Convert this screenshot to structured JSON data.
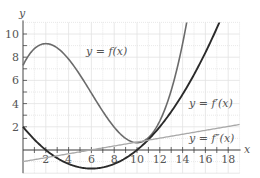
{
  "chart_data": {
    "type": "line",
    "title": "",
    "xlabel": "x",
    "ylabel": "y",
    "xlim": [
      0,
      19
    ],
    "ylim": [
      -2,
      11
    ],
    "grid": true,
    "x_ticks": [
      2,
      4,
      6,
      8,
      10,
      12,
      14,
      16,
      18
    ],
    "y_ticks": [
      2,
      4,
      6,
      8,
      10
    ],
    "x_tick_labels": [
      "2",
      "4",
      "6",
      "8",
      "10",
      "12",
      "14",
      "16",
      "18"
    ],
    "y_tick_labels": [
      "2",
      "4",
      "6",
      "8",
      "10"
    ],
    "series": [
      {
        "name": "y = f(x)",
        "label": "y = f(x)",
        "color": "#6b6b6b",
        "x": [
          0,
          1,
          2,
          3,
          4,
          5,
          6,
          7,
          8,
          9,
          10,
          11,
          12,
          13,
          14,
          14.5
        ],
        "values": [
          7.3,
          8.6,
          9.0,
          8.8,
          8.1,
          7.0,
          5.8,
          4.5,
          3.1,
          1.9,
          1.1,
          1.5,
          2.9,
          5.3,
          9.0,
          11.0
        ]
      },
      {
        "name": "y = f'(x)",
        "label": "y = f′(x)",
        "color": "#2a2a2a",
        "x": [
          0,
          2,
          4,
          6,
          8,
          10,
          12,
          14,
          16,
          17.6
        ],
        "values": [
          2.0,
          0.0,
          -1.2,
          -1.6,
          -1.2,
          0.0,
          2.0,
          4.8,
          8.4,
          11.0
        ]
      },
      {
        "name": "y = f''(x)",
        "label": "y = f″(x)",
        "color": "#a8a8a8",
        "x": [
          0,
          6,
          19
        ],
        "values": [
          -1.0,
          0.0,
          2.2
        ]
      }
    ],
    "annotations": [
      {
        "text": "y = f(x)",
        "x": 5.8,
        "y": 8.6
      },
      {
        "text": "y = f′(x)",
        "x": 14.6,
        "y": 3.8
      },
      {
        "text": "y = f″(x)",
        "x": 14.6,
        "y": 0.7
      }
    ]
  },
  "labels": {
    "x_axis": "x",
    "y_axis": "y",
    "f": "y = f(x)",
    "fp": "y = f′(x)",
    "fpp": "y = f″(x)"
  }
}
